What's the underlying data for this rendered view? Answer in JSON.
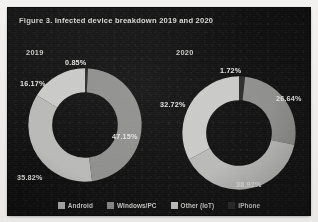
{
  "figure": {
    "title": "Figure 3. Infected device breakdown 2019 and 2020"
  },
  "legend": {
    "items": [
      {
        "label": "Android",
        "color": "#b9b9b7"
      },
      {
        "label": "Windows/PC",
        "color": "#8f8f8d"
      },
      {
        "label": "Other (IoT)",
        "color": "#c9c9c7"
      },
      {
        "label": "iPhone",
        "color": "#2e2e2e"
      }
    ]
  },
  "charts": [
    {
      "year_label": "2019",
      "labels": [
        "0.85%",
        "47.15%",
        "35.82%",
        "16.17%"
      ]
    },
    {
      "year_label": "2020",
      "labels": [
        "1.72%",
        "26.64%",
        "38.92%",
        "32.72%"
      ]
    }
  ],
  "chart_data": [
    {
      "type": "pie",
      "title": "2019",
      "subtitle": "Infected device breakdown 2019",
      "categories": [
        "iPhone",
        "Windows/PC",
        "Android",
        "Other (IoT)"
      ],
      "values": [
        0.85,
        47.15,
        35.82,
        16.17
      ],
      "value_labels": [
        "0.85%",
        "47.15%",
        "35.82%",
        "16.17%"
      ],
      "colors": [
        "#2e2e2e",
        "#8f8f8d",
        "#b9b9b7",
        "#c9c9c7"
      ],
      "unit": "%",
      "donut": true,
      "inner_radius_ratio": 0.58,
      "start_angle_deg": -90,
      "legend_position": "bottom",
      "grid": false
    },
    {
      "type": "pie",
      "title": "2020",
      "subtitle": "Infected device breakdown 2020",
      "categories": [
        "iPhone",
        "Windows/PC",
        "Android",
        "Other (IoT)"
      ],
      "values": [
        1.72,
        26.64,
        38.92,
        32.72
      ],
      "value_labels": [
        "1.72%",
        "26.64%",
        "38.92%",
        "32.72%"
      ],
      "colors": [
        "#2e2e2e",
        "#8f8f8d",
        "#b9b9b7",
        "#c9c9c7"
      ],
      "unit": "%",
      "donut": true,
      "inner_radius_ratio": 0.58,
      "start_angle_deg": -90,
      "legend_position": "bottom",
      "grid": false
    }
  ]
}
